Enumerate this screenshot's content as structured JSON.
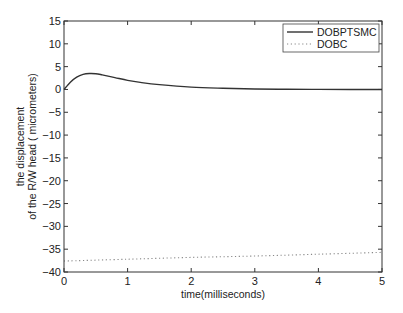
{
  "chart_data": {
    "type": "line",
    "title": "",
    "xlabel": "time(milliseconds)",
    "ylabel_lines": [
      "the displacement",
      "of the R/W head ( micrometers)"
    ],
    "xlim": [
      0,
      5
    ],
    "ylim": [
      -40,
      15
    ],
    "xticks": [
      0,
      1,
      2,
      3,
      4,
      5
    ],
    "yticks": [
      15,
      10,
      5,
      0,
      -5,
      -10,
      -15,
      -20,
      -25,
      -30,
      -35,
      -40
    ],
    "grid": false,
    "legend_position": "upper right",
    "series": [
      {
        "name": "DOBPTSMC",
        "style": "solid",
        "color": "#333333",
        "x": [
          0,
          0.1,
          0.2,
          0.3,
          0.4,
          0.5,
          0.6,
          0.8,
          1.0,
          1.2,
          1.5,
          2.0,
          2.5,
          3.0,
          3.5,
          4.0,
          4.5,
          5.0
        ],
        "y": [
          0,
          1.6,
          2.7,
          3.3,
          3.5,
          3.45,
          3.2,
          2.6,
          2.0,
          1.55,
          1.05,
          0.5,
          0.25,
          0.1,
          0.05,
          0.02,
          0.0,
          0.0
        ]
      },
      {
        "name": "DOBC",
        "style": "dotted",
        "color": "#888888",
        "x": [
          0,
          1,
          2,
          3,
          4,
          5
        ],
        "y": [
          -37.6,
          -37.2,
          -36.8,
          -36.5,
          -36.1,
          -35.7
        ]
      }
    ]
  }
}
